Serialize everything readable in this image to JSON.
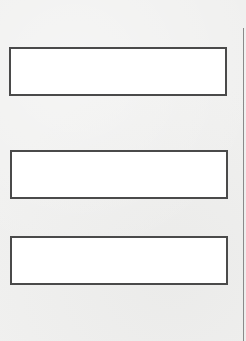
{
  "page": {
    "background_color": "#f0f0ef",
    "box_border_color": "#4a4a4a",
    "box_fill_color": "#ffffff",
    "edge_line_color": "#8a8a8a"
  },
  "boxes": [
    {
      "id": 1,
      "text": ""
    },
    {
      "id": 2,
      "text": ""
    },
    {
      "id": 3,
      "text": ""
    }
  ]
}
